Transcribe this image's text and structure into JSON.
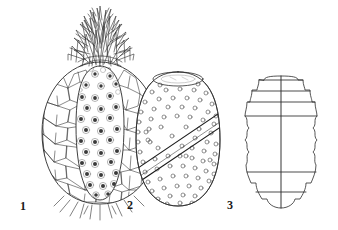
{
  "plate": {
    "background_color": "#ffffff",
    "ink_color": "#2b2b2b",
    "description": "Botanical line drawing plate with three numbered fruit figures",
    "width": 338,
    "height": 230
  },
  "figures": [
    {
      "number": "1",
      "name": "pineapple-with-crown",
      "caption_label": "1",
      "label_x": 20,
      "label_y": 200,
      "outline": {
        "center_x": 100,
        "top_y": 62,
        "bottom_y": 205,
        "half_width": 58
      },
      "features": {
        "crown_leaves": 46,
        "crown_top_y": 8,
        "crown_base_y": 66,
        "scale_texture": "polygonal-hexagonal-scales",
        "scale_cell_count": 150,
        "inner_panel": "dotted-pale-core",
        "core_dot_count": 44,
        "core_dot_color": "#3a3a3a",
        "basal_rootlets": 12
      }
    },
    {
      "number": "2",
      "name": "dotted-ovoid-with-diagonal-band",
      "caption_label": "2",
      "label_x": 127,
      "label_y": 199,
      "outline": {
        "center_x": 178,
        "top_y": 72,
        "bottom_y": 206,
        "half_width": 42
      },
      "features": {
        "apex_opening": "flat-ellipse-cut-top",
        "apex_ellipse_rx": 25,
        "apex_ellipse_ry": 7,
        "dot_pattern": "scattered-small-open-circles",
        "dot_count": 96,
        "dot_radius": 2,
        "diagonal_band": "double-line-stripe-lower-left-to-upper-right",
        "band_line_count": 3
      }
    },
    {
      "number": "3",
      "name": "scalloped-barrel-with-bands",
      "caption_label": "3",
      "label_x": 227,
      "label_y": 199,
      "outline": {
        "center_x": 281,
        "top_y": 76,
        "bottom_y": 208,
        "half_width": 36
      },
      "features": {
        "edge_style": "scalloped-lobed-margin",
        "scallop_count": 9,
        "horizontal_bands": 6,
        "vertical_midline": true,
        "band_y_positions": [
          80,
          93,
          104,
          114,
          172,
          192
        ]
      }
    }
  ]
}
